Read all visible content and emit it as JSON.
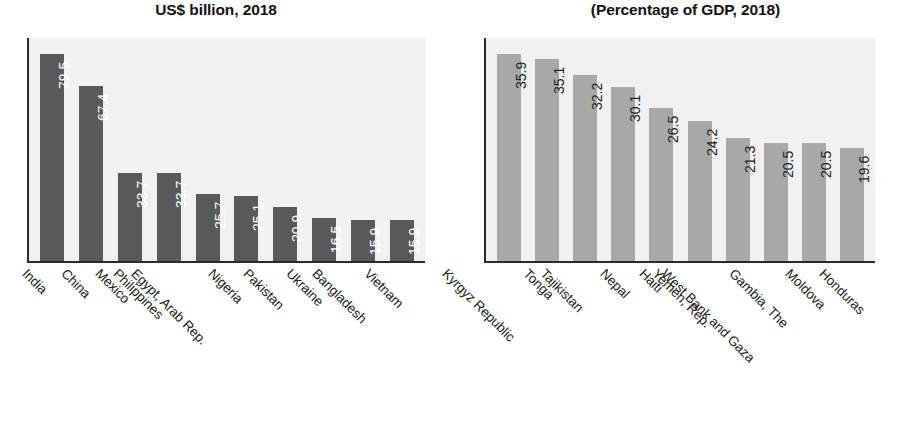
{
  "chart_data": [
    {
      "type": "bar",
      "title": "US$ billion, 2018",
      "xlabel": "",
      "ylabel": "",
      "ylim": [
        0,
        85
      ],
      "grid": false,
      "legend": "none",
      "bar_color": "#595959",
      "plot_bg": "#f1f1f1",
      "label_color": "#ffffff",
      "categories": [
        "India",
        "China",
        "Mexico",
        "Philippines",
        "Egypt, Arab Rep.",
        "Nigeria",
        "Pakistan",
        "Ukraine",
        "Bangladesh",
        "Vietnam"
      ],
      "values": [
        79.5,
        67.4,
        33.7,
        33.7,
        25.7,
        25.1,
        20.9,
        16.5,
        15.9,
        15.9
      ],
      "value_labels": [
        "79.5",
        "67.4",
        "33.7",
        "33.7",
        "25.7",
        "25.1",
        "20.9",
        "16.5",
        "15.9",
        "15.9"
      ]
    },
    {
      "type": "bar",
      "title": "(Percentage of GDP, 2018)",
      "xlabel": "",
      "ylabel": "",
      "ylim": [
        0,
        38
      ],
      "grid": false,
      "legend": "none",
      "bar_color": "#a8a8a8",
      "plot_bg": "#f1f1f1",
      "label_color": "#222222",
      "categories": [
        "Kyrgyz Republic",
        "Tonga",
        "Tajikistan",
        "Nepal",
        "Haiti",
        "Yemen, Rep.",
        "West Bank and Gaza",
        "Gambia, The",
        "Moldova",
        "Honduras"
      ],
      "values": [
        35.9,
        35.1,
        32.2,
        30.1,
        26.5,
        24.2,
        21.3,
        20.5,
        20.5,
        19.6
      ],
      "value_labels": [
        "35.9",
        "35.1",
        "32.2",
        "30.1",
        "26.5",
        "24.2",
        "21.3",
        "20.5",
        "20.5",
        "19.6"
      ]
    }
  ]
}
